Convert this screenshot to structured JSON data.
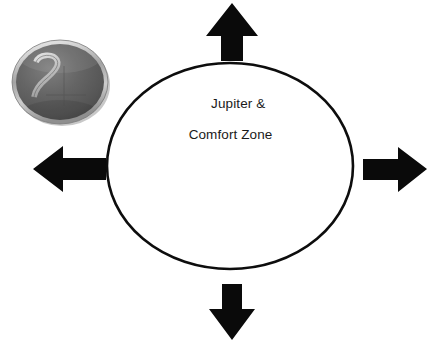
{
  "figure": {
    "title": "Jupiter & Comfort Zone",
    "background_color": "#ffffff",
    "width": 434,
    "height": 343
  },
  "zone": {
    "label_line1": "Jupiter &",
    "label_line2": "Comfort Zone",
    "shape": "ellipse",
    "fill_color": "#ffffff",
    "stroke_color": "#000000",
    "center_x": 230,
    "center_y": 166,
    "radius_x": 123,
    "radius_y": 103
  },
  "medallion": {
    "symbol_name": "jupiter-symbol",
    "symbol_glyph": "♃",
    "disc_color": "#5d5d5d",
    "rim_color": "#cfcfcf",
    "glyph_color": "#c8c8c8",
    "shadow_color": "#9a9a9a"
  },
  "arrows": [
    {
      "name": "arrow-up",
      "direction": "up",
      "color": "#000000",
      "tip_x": 232,
      "tip_y": 3,
      "tail_x": 232,
      "tail_y": 61
    },
    {
      "name": "arrow-right",
      "direction": "right",
      "color": "#000000",
      "tip_x": 427,
      "tip_y": 169,
      "tail_x": 363,
      "tail_y": 169
    },
    {
      "name": "arrow-down",
      "direction": "down",
      "color": "#000000",
      "tip_x": 232,
      "tip_y": 340,
      "tail_x": 232,
      "tail_y": 284
    },
    {
      "name": "arrow-left",
      "direction": "left",
      "color": "#000000",
      "tip_x": 33,
      "tip_y": 169,
      "tail_x": 106,
      "tail_y": 169
    }
  ]
}
